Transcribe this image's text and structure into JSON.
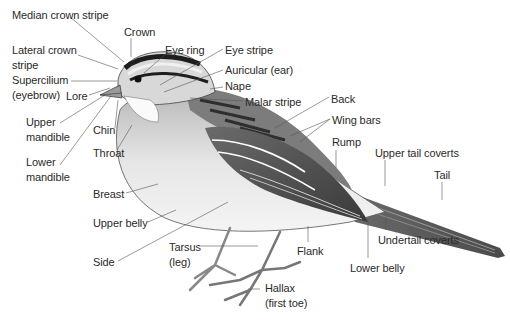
{
  "diagram": {
    "labels": [
      {
        "id": "median-crown-stripe",
        "text": "Median crown stripe",
        "x": 12,
        "y": 8
      },
      {
        "id": "crown",
        "text": "Crown",
        "x": 124,
        "y": 25
      },
      {
        "id": "lateral-crown-stripe",
        "text": "Lateral crown\nstripe",
        "x": 12,
        "y": 43
      },
      {
        "id": "eye-ring",
        "text": "Eye ring",
        "x": 165,
        "y": 43
      },
      {
        "id": "eye-stripe",
        "text": "Eye stripe",
        "x": 225,
        "y": 43
      },
      {
        "id": "supercilium",
        "text": "Supercilium\n(eyebrow)",
        "x": 12,
        "y": 73
      },
      {
        "id": "auricular",
        "text": "Auricular (ear)",
        "x": 225,
        "y": 63
      },
      {
        "id": "lore",
        "text": "Lore",
        "x": 66,
        "y": 89
      },
      {
        "id": "nape",
        "text": "Nape",
        "x": 225,
        "y": 79
      },
      {
        "id": "malar-stripe",
        "text": "Malar stripe",
        "x": 245,
        "y": 95
      },
      {
        "id": "back",
        "text": "Back",
        "x": 331,
        "y": 92
      },
      {
        "id": "upper-mandible",
        "text": "Upper\nmandible",
        "x": 26,
        "y": 115
      },
      {
        "id": "wing-bars",
        "text": "Wing bars",
        "x": 332,
        "y": 113
      },
      {
        "id": "chin",
        "text": "Chin",
        "x": 93,
        "y": 123
      },
      {
        "id": "rump",
        "text": "Rump",
        "x": 332,
        "y": 135
      },
      {
        "id": "throat",
        "text": "Throat",
        "x": 93,
        "y": 146
      },
      {
        "id": "upper-tail-coverts",
        "text": "Upper tail coverts",
        "x": 375,
        "y": 146
      },
      {
        "id": "lower-mandible",
        "text": "Lower\nmandible",
        "x": 26,
        "y": 155
      },
      {
        "id": "tail",
        "text": "Tail",
        "x": 434,
        "y": 168
      },
      {
        "id": "breast",
        "text": "Breast",
        "x": 93,
        "y": 187
      },
      {
        "id": "upper-belly",
        "text": "Upper belly",
        "x": 93,
        "y": 216
      },
      {
        "id": "tarsus",
        "text": "Tarsus\n(leg)",
        "x": 169,
        "y": 240
      },
      {
        "id": "undertail-coverts",
        "text": "Undertail coverts",
        "x": 378,
        "y": 233
      },
      {
        "id": "flank",
        "text": "Flank",
        "x": 297,
        "y": 244
      },
      {
        "id": "side",
        "text": "Side",
        "x": 93,
        "y": 255
      },
      {
        "id": "lower-belly",
        "text": "Lower belly",
        "x": 350,
        "y": 261
      },
      {
        "id": "hallax",
        "text": "Hallax\n(first toe)",
        "x": 265,
        "y": 281
      }
    ]
  }
}
